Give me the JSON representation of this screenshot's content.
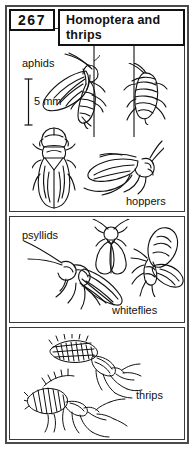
{
  "page": {
    "number": "267",
    "title": "Homoptera  and\nthrips"
  },
  "scale": {
    "label": "5 mm",
    "bar_name": "scale-bar"
  },
  "panels": [
    {
      "id": "aphids",
      "labels": [
        "aphids",
        "hoppers"
      ],
      "top_label": "aphids",
      "bottom_label": "hoppers",
      "figures": [
        {
          "name": "winged-aphid-on-stem",
          "caption": "aphids"
        },
        {
          "name": "wingless-aphid-on-stem",
          "caption": "aphids"
        },
        {
          "name": "leafhopper-dorsal-view",
          "caption": "hoppers"
        },
        {
          "name": "leafhopper-lateral-view",
          "caption": "hoppers"
        }
      ]
    },
    {
      "id": "psyllids",
      "top_label": "psyllids",
      "bottom_label": "whiteflies",
      "figures": [
        {
          "name": "psyllid-lateral-view",
          "caption": "psyllids"
        },
        {
          "name": "psyllid-dorsal-view",
          "caption": "psyllids"
        },
        {
          "name": "whitefly-dorsal-view",
          "caption": "whiteflies"
        }
      ]
    },
    {
      "id": "thrips",
      "bottom_label": "thrips",
      "figures": [
        {
          "name": "thrips-upper-view",
          "caption": "thrips"
        },
        {
          "name": "thrips-lower-view",
          "caption": "thrips"
        }
      ]
    }
  ],
  "colors": {
    "ink": "#111111",
    "frame": "#4a4a4a",
    "panel_border": "#3a3a3a",
    "paper": "#ffffff"
  }
}
